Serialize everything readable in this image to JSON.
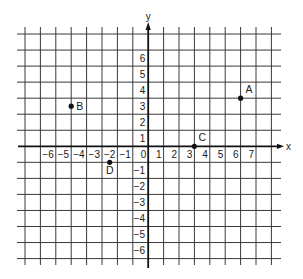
{
  "diagram": {
    "type": "coordinate-plane",
    "colors": {
      "grid": "#3a3a3a",
      "axis": "#111111",
      "point": "#111111",
      "background": "#ffffff"
    },
    "axes": {
      "x_name": "x",
      "y_name": "y",
      "x_tick_labels": [
        "−6",
        "−5",
        "−4",
        "−3",
        "−2",
        "−1",
        "0",
        "1",
        "2",
        "3",
        "4",
        "5",
        "6",
        "7"
      ],
      "x_tick_values": [
        -6,
        -5,
        -4,
        -3,
        -2,
        -1,
        0,
        1,
        2,
        3,
        4,
        5,
        6,
        7
      ],
      "y_tick_labels": [
        "6",
        "5",
        "4",
        "3",
        "2",
        "1",
        "−1",
        "−2",
        "−3",
        "−4",
        "−5",
        "−6"
      ],
      "y_tick_values": [
        6,
        5,
        4,
        3,
        2,
        1,
        -1,
        -2,
        -3,
        -4,
        -5,
        -6
      ],
      "grid_x_range": [
        -8,
        8
      ],
      "grid_y_range": [
        -7,
        7
      ]
    },
    "points": [
      {
        "label": "A",
        "x": 6,
        "y": 3
      },
      {
        "label": "B",
        "x": -5,
        "y": 2.5
      },
      {
        "label": "C",
        "x": 3,
        "y": 0
      },
      {
        "label": "D",
        "x": -2.5,
        "y": -1
      }
    ]
  }
}
